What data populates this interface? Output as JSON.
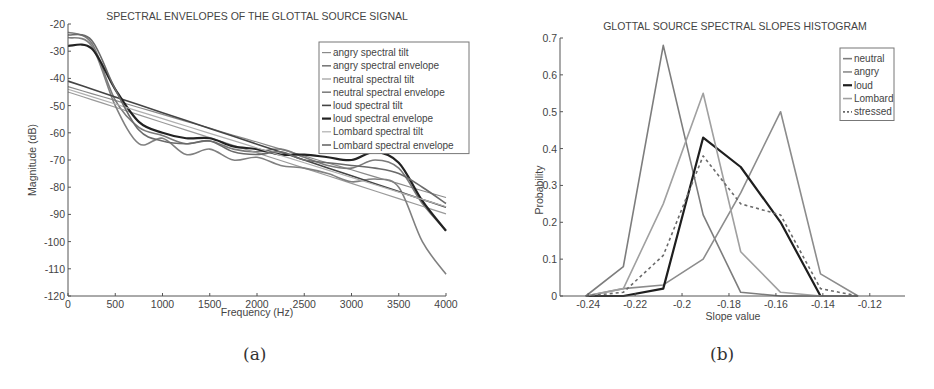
{
  "chart_data": [
    {
      "type": "line",
      "id": "a",
      "title": "SPECTRAL ENVELOPES OF THE GLOTTAL SOURCE SIGNAL",
      "xlabel": "Frequency (Hz)",
      "ylabel": "Magnitude (dB)",
      "xlim": [
        0,
        4000
      ],
      "ylim": [
        -120,
        -20
      ],
      "xticks": [
        0,
        500,
        1000,
        1500,
        2000,
        2500,
        3000,
        3500,
        4000
      ],
      "yticks": [
        -20,
        -30,
        -40,
        -50,
        -60,
        -70,
        -80,
        -90,
        -100,
        -110,
        -120
      ],
      "grid": false,
      "legend_position": "upper right",
      "x": [
        0,
        250,
        500,
        750,
        1000,
        1250,
        1500,
        1750,
        2000,
        2250,
        2500,
        2750,
        3000,
        3250,
        3500,
        3750,
        4000
      ],
      "series": [
        {
          "name": "angry spectral tilt",
          "color": "#8a8a8a",
          "width": 1.2,
          "values": [
            -43,
            -45.6,
            -48.1,
            -50.7,
            -53.2,
            -55.8,
            -58.3,
            -60.9,
            -63.4,
            -66,
            -68.5,
            -71.1,
            -73.6,
            -76.2,
            -78.7,
            -81.3,
            -83.8
          ]
        },
        {
          "name": "angry spectral envelope",
          "color": "#7a7a7a",
          "width": 1.6,
          "values": [
            -23,
            -27,
            -48,
            -58,
            -61,
            -64,
            -63,
            -66,
            -67,
            -66,
            -69,
            -72,
            -73,
            -70,
            -73,
            -86,
            -96
          ]
        },
        {
          "name": "neutral spectral tilt",
          "color": "#9a9a9a",
          "width": 1.2,
          "values": [
            -45,
            -47.8,
            -50.6,
            -53.4,
            -56.2,
            -59,
            -61.8,
            -64.6,
            -67.4,
            -70.2,
            -73,
            -75.8,
            -78.6,
            -81.4,
            -84.2,
            -87,
            -89.8
          ]
        },
        {
          "name": "neutral spectral envelope",
          "color": "#808080",
          "width": 1.6,
          "values": [
            -25,
            -28,
            -50,
            -64,
            -62,
            -68,
            -66,
            -70,
            -69,
            -72,
            -73,
            -75,
            -78,
            -77,
            -80,
            -100,
            -112
          ]
        },
        {
          "name": "loud spectral tilt",
          "color": "#444444",
          "width": 1.6,
          "values": [
            -41,
            -43.9,
            -46.8,
            -49.7,
            -52.6,
            -55.5,
            -58.4,
            -61.3,
            -64.2,
            -67.1,
            -70,
            -72.9,
            -75.8,
            -78.7,
            -81.6,
            -84.5,
            -87.4
          ]
        },
        {
          "name": "loud spectral envelope",
          "color": "#222222",
          "width": 2.2,
          "values": [
            -28,
            -29,
            -44,
            -56,
            -60,
            -62,
            -62,
            -65,
            -66,
            -68,
            -68,
            -69,
            -70,
            -67,
            -71,
            -85,
            -96
          ]
        },
        {
          "name": "Lombard spectral tilt",
          "color": "#b0b0b0",
          "width": 1.2,
          "values": [
            -44,
            -46.7,
            -49.4,
            -52.1,
            -54.8,
            -57.5,
            -60.2,
            -62.9,
            -65.6,
            -68.3,
            -71,
            -73.7,
            -76.4,
            -79.1,
            -81.8,
            -84.5,
            -87.2
          ]
        },
        {
          "name": "Lombard spectral envelope",
          "color": "#6a6a6a",
          "width": 1.6,
          "values": [
            -24,
            -26,
            -44,
            -59,
            -63,
            -64,
            -63,
            -67,
            -68,
            -67,
            -70,
            -71,
            -72,
            -73,
            -75,
            -80,
            -86
          ]
        }
      ],
      "caption": "(a)"
    },
    {
      "type": "line",
      "id": "b",
      "title": "GLOTTAL SOURCE SPECTRAL SLOPES HISTOGRAM",
      "xlabel": "Slope value",
      "ylabel": "Probability",
      "xlim": [
        -0.252,
        -0.105
      ],
      "ylim": [
        0,
        0.7
      ],
      "xticks": [
        -0.24,
        -0.22,
        -0.2,
        -0.18,
        -0.16,
        -0.14,
        -0.12
      ],
      "xtick_labels": [
        "-0.24",
        "-0.22",
        "-0.2",
        "-0.18",
        "-0.16",
        "-0.14",
        "-0.12"
      ],
      "yticks": [
        0,
        0.1,
        0.2,
        0.3,
        0.4,
        0.5,
        0.6,
        0.7
      ],
      "ytick_labels": [
        "0",
        "0.1",
        "0.2",
        "0.3",
        "0.4",
        "0.5",
        "0.6",
        "0.7"
      ],
      "grid": false,
      "legend_position": "upper right",
      "x": [
        -0.241,
        -0.225,
        -0.208,
        -0.191,
        -0.175,
        -0.158,
        -0.141,
        -0.125
      ],
      "series": [
        {
          "name": "neutral",
          "color": "#7d7d7d",
          "width": 1.6,
          "dash": "",
          "values": [
            0,
            0.08,
            0.68,
            0.22,
            0.01,
            0,
            0,
            0
          ]
        },
        {
          "name": "angry",
          "color": "#8c8c8c",
          "width": 1.6,
          "dash": "",
          "values": [
            0,
            0.02,
            0.03,
            0.1,
            0.28,
            0.5,
            0.06,
            0
          ]
        },
        {
          "name": "loud",
          "color": "#1e1e1e",
          "width": 2.2,
          "dash": "",
          "values": [
            0,
            0,
            0.02,
            0.43,
            0.35,
            0.2,
            0,
            0
          ]
        },
        {
          "name": "Lombard",
          "color": "#a0a0a0",
          "width": 1.6,
          "dash": "",
          "values": [
            0,
            0.02,
            0.25,
            0.55,
            0.12,
            0.01,
            0,
            0
          ]
        },
        {
          "name": "stressed",
          "color": "#6a6a6a",
          "width": 1.6,
          "dash": "3,3",
          "values": [
            0,
            0.01,
            0.11,
            0.38,
            0.25,
            0.22,
            0.02,
            0
          ]
        }
      ],
      "caption": "(b)"
    }
  ]
}
